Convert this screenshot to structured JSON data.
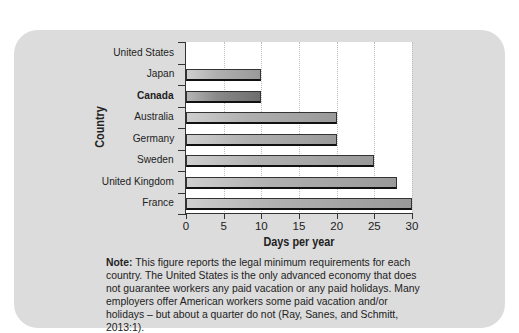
{
  "chart_data": {
    "type": "bar",
    "orientation": "horizontal",
    "title": "",
    "xlabel": "Days per year",
    "ylabel": "Country",
    "categories": [
      "United States",
      "Japan",
      "Canada",
      "Australia",
      "Germany",
      "Sweden",
      "United Kingdom",
      "France"
    ],
    "values": [
      0,
      10,
      10,
      20,
      20,
      25,
      28,
      30
    ],
    "highlighted_category": "Canada",
    "xlim": [
      0,
      30
    ],
    "xticks": [
      "0",
      "5",
      "10",
      "15",
      "20",
      "25",
      "30"
    ],
    "grid": true,
    "legend": null
  },
  "note": {
    "label": "Note:",
    "text": " This figure reports the legal minimum requirements for each country. The United States is the only advanced economy that does not guarantee workers any paid vacation or any paid holidays. Many employers offer American workers some paid vacation and/or holidays – but about a quarter do not (Ray, Sanes, and Schmitt, 2013:1)."
  },
  "colors": {
    "panel": "#dcdcdc",
    "bar": "#b0b0b0",
    "bar_highlight": "#808080"
  }
}
